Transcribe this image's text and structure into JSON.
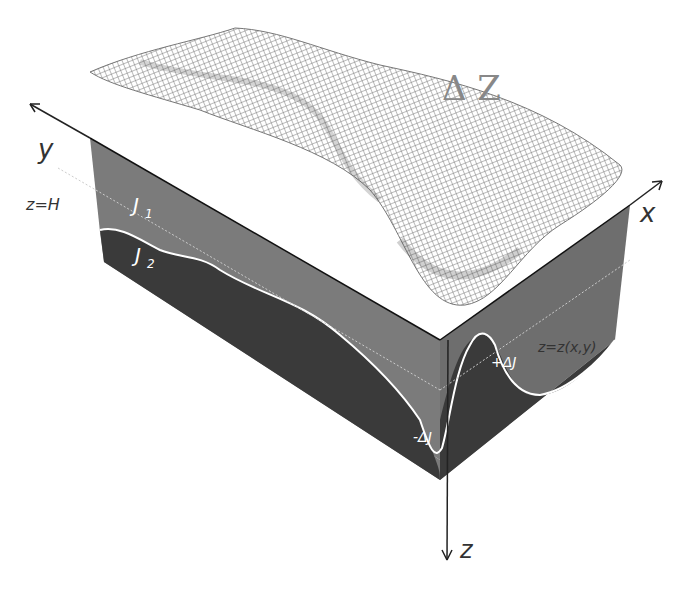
{
  "diagram": {
    "title": "",
    "labels": {
      "delta_z": "Δ Z",
      "y_axis": "y",
      "x_axis": "x",
      "z_axis": "z",
      "z_eq_h": "z=H",
      "j1": "J",
      "j1_sub": "1",
      "j2": "J",
      "j2_sub": "2",
      "interface": "z=z(x,y)",
      "plus_delta_j": "+ΔJ",
      "minus_delta_j": "-ΔJ"
    },
    "colors": {
      "upper_layer": "#7b7b7b",
      "lower_layer": "#3a3a3a",
      "interface_line": "#ffffff",
      "mesh": "#6a6a6a",
      "axis": "#222222"
    }
  }
}
